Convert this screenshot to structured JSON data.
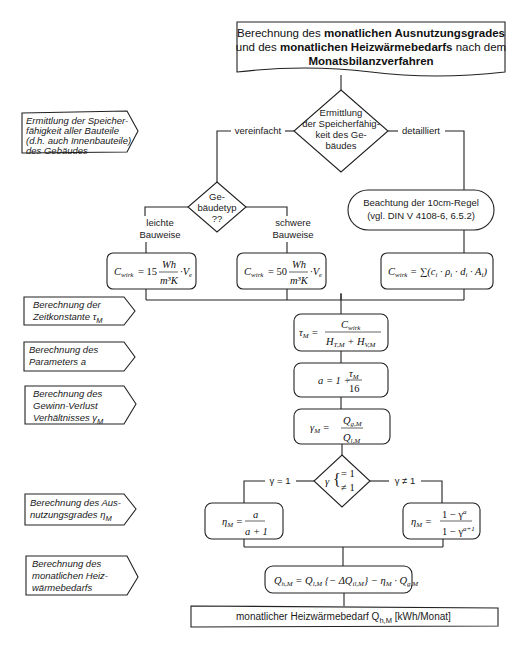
{
  "title": {
    "line1_a": "Berechnung des ",
    "line1_b": "monatlichen Ausnutzungsgrades",
    "line2_a": "und des ",
    "line2_b": "monatlichen Heizwärmebedarfs",
    "line2_c": " nach dem",
    "line3": "Monatsbilanzverfahren"
  },
  "side_labels": [
    {
      "lines": [
        "Ermittlung der Speicher-",
        "fähigkeit aller Bauteile",
        "(d.h. auch Innenbauteile)",
        "des Gebäudes"
      ]
    },
    {
      "lines": [
        "Berechnung der",
        "Zeitkonstante τ"
      ],
      "sub": "M"
    },
    {
      "lines": [
        "Berechnung des",
        "Parameters a"
      ]
    },
    {
      "lines": [
        "Berechnung des",
        "Gewinn-Verlust",
        "Verhältnisses γ"
      ],
      "sub": "M"
    },
    {
      "lines": [
        "Berechnung des Aus-",
        "nutzungsgrades  η"
      ],
      "sub": "M"
    },
    {
      "lines": [
        "Berechnung des",
        "monatlichen Heiz-",
        "wärmebedarfs"
      ]
    }
  ],
  "decision_storage": {
    "lines": [
      "Ermittlung",
      "der Speicherfähig-",
      "keit des Ge-",
      "bäudes"
    ],
    "left_branch": "vereinfacht",
    "right_branch": "detailliert"
  },
  "decision_building_type": {
    "lines": [
      "Ge-",
      "bäudetyp",
      "??"
    ],
    "left_branch": [
      "leichte",
      "Bauweise"
    ],
    "right_branch": [
      "schwere",
      "Bauweise"
    ]
  },
  "rule_note": {
    "lines": [
      "Beachtung der 10cm-Regel",
      "(vgl. DIN V 4108-6, 6.5.2)"
    ]
  },
  "formulas": {
    "c_light": {
      "lhs": "C",
      "lhs_sub": "wirk",
      "coef": "= 15",
      "num": "Wh",
      "den": "m³K",
      "tail": "· V",
      "tail_sub": "e"
    },
    "c_heavy": {
      "lhs": "C",
      "lhs_sub": "wirk",
      "coef": "= 50",
      "num": "Wh",
      "den": "m³K",
      "tail": "· V",
      "tail_sub": "e"
    },
    "c_detail": {
      "text": "C",
      "sub": "wirk",
      "rhs": "= ∑(c·ρ·d·A)",
      "rhs_pretty": "= ∑ (cᵢ · ρᵢ · dᵢ · Aᵢ)"
    },
    "tau": {
      "lhs": "τ",
      "lhs_sub": "M",
      "num": "C",
      "num_sub": "wirk",
      "den": "H + H",
      "den_a": "H",
      "den_a_sub": "T,M",
      "den_b": "H",
      "den_b_sub": "V,M"
    },
    "a": {
      "lhs": "a = 1 +",
      "num": "τ",
      "num_sub": "M",
      "den": "16"
    },
    "gamma": {
      "lhs": "γ",
      "lhs_sub": "M",
      "num": "Q",
      "num_sub": "g,M",
      "den": "Q",
      "den_sub": "l,M"
    },
    "eta_eq1": {
      "lhs": "η",
      "lhs_sub": "M",
      "num": "a",
      "den": "a + 1"
    },
    "eta_neq1": {
      "lhs": "η",
      "lhs_sub": "M",
      "num": "1 − γ",
      "num_sup": "a",
      "den": "1 − γ",
      "den_sup": "a+1"
    },
    "qh": {
      "text": "Q_h,M = Q_l,M {− ΔQ_il,M} − η_M · Q_g,M"
    }
  },
  "decision_gamma": {
    "symbol": "γ",
    "case1": "= 1",
    "case2": "≠ 1",
    "left_branch": "γ = 1",
    "right_branch": "γ ≠ 1"
  },
  "result": {
    "text": "monatlicher Heizwärmebedarf  Q",
    "sub": "h,M",
    "unit": " [kWh/Monat]"
  }
}
